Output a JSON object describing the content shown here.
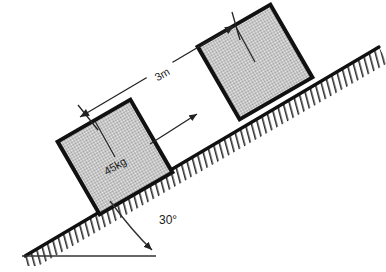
{
  "diagram": {
    "incline_angle_label": "30°",
    "distance_label": "3m",
    "mass_label": "45kg",
    "colors": {
      "outline": "#000000",
      "block_fill": "#d0d0d0",
      "block_border": "#111111",
      "hatch": "#2b2b2b",
      "thin_line": "#333333",
      "background": "#ffffff"
    },
    "incline": {
      "angle_degrees": 30,
      "apex_x": 25,
      "apex_y": 256,
      "top_x": 378,
      "top_y": 48
    },
    "blocks": [
      {
        "name": "lower-block",
        "label": "45kg",
        "center_x": 115,
        "center_y": 157,
        "size": 84,
        "rotation_degrees": -30
      },
      {
        "name": "upper-block",
        "label": "",
        "center_x": 255,
        "center_y": 62,
        "size": 84,
        "rotation_degrees": -30
      }
    ],
    "dimension": {
      "label": "3m",
      "from_x": 78,
      "from_y": 117,
      "to_x": 236,
      "to_y": 26
    },
    "motion_arrow": {
      "from_x": 150,
      "from_y": 143,
      "to_x": 196,
      "to_y": 115
    },
    "baseline": {
      "from_x": 25,
      "from_y": 256,
      "to_x": 156,
      "to_y": 256
    }
  }
}
